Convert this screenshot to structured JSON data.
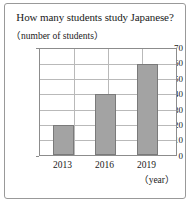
{
  "chart_data": {
    "type": "bar",
    "title": "How many students study Japanese?",
    "categories": [
      "2013",
      "2016",
      "2019"
    ],
    "values": [
      20,
      40,
      60
    ],
    "xlabel": "（year）",
    "ylabel": "（number of students）",
    "ylim": [
      0,
      70
    ],
    "ytick_step": 10,
    "yticks": [
      0,
      10,
      20,
      30,
      40,
      50,
      60,
      70
    ],
    "ytick_labels": [
      "0",
      "10",
      "20",
      "30",
      "40",
      "50",
      "60",
      "70"
    ],
    "grid": true,
    "legend": false,
    "bar_color": "#a3a3a3",
    "bar_border_color": "#7a7a7a",
    "axis_color": "#8c8c8c",
    "grid_color": "#b9b9b9",
    "frame_color": "#999999",
    "background": "#ffffff"
  },
  "frame": {
    "border_color": "#999999"
  }
}
